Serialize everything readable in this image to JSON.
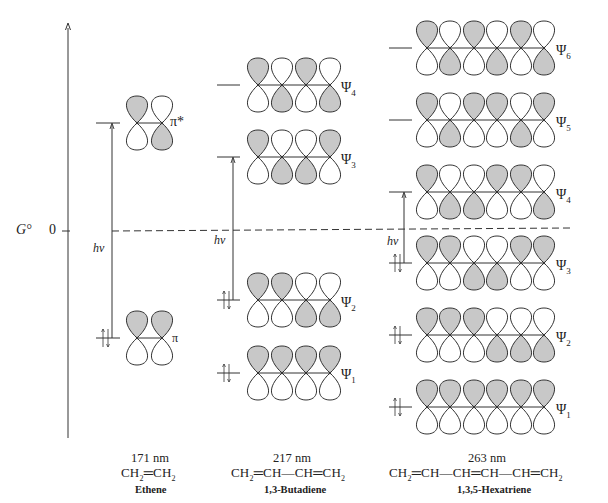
{
  "axis": {
    "label": "G°",
    "zero_label": "0",
    "hv_label": "hν"
  },
  "colors": {
    "shaded_lobe": "#c8c8c8",
    "line": "#333333",
    "background": "#ffffff"
  },
  "molecules": [
    {
      "name": "Ethene",
      "wavelength": "171 nm",
      "formula": "CH₂═CH₂",
      "orbitals": [
        {
          "label": "π*",
          "sub": "",
          "occupied": false,
          "top_shaded": [
            true,
            false
          ]
        },
        {
          "label": "π",
          "sub": "",
          "occupied": true,
          "top_shaded": [
            true,
            true
          ]
        }
      ]
    },
    {
      "name": "1,3-Butadiene",
      "wavelength": "217 nm",
      "formula": "CH₂═CH—CH═CH₂",
      "orbitals": [
        {
          "label": "Ψ",
          "sub": "4",
          "occupied": false,
          "top_shaded": [
            true,
            false,
            true,
            false
          ]
        },
        {
          "label": "Ψ",
          "sub": "3",
          "occupied": false,
          "top_shaded": [
            true,
            false,
            false,
            true
          ]
        },
        {
          "label": "Ψ",
          "sub": "2",
          "occupied": true,
          "top_shaded": [
            true,
            true,
            false,
            false
          ]
        },
        {
          "label": "Ψ",
          "sub": "1",
          "occupied": true,
          "top_shaded": [
            true,
            true,
            true,
            true
          ]
        }
      ]
    },
    {
      "name": "1,3,5-Hexatriene",
      "wavelength": "263 nm",
      "formula": "CH₂═CH—CH═CH—CH═CH₂",
      "orbitals": [
        {
          "label": "Ψ",
          "sub": "6",
          "occupied": false,
          "top_shaded": [
            true,
            false,
            true,
            false,
            true,
            false
          ]
        },
        {
          "label": "Ψ",
          "sub": "5",
          "occupied": false,
          "top_shaded": [
            true,
            false,
            true,
            true,
            false,
            true
          ]
        },
        {
          "label": "Ψ",
          "sub": "4",
          "occupied": false,
          "top_shaded": [
            true,
            false,
            false,
            true,
            true,
            false
          ]
        },
        {
          "label": "Ψ",
          "sub": "3",
          "occupied": true,
          "top_shaded": [
            true,
            true,
            false,
            false,
            true,
            true
          ]
        },
        {
          "label": "Ψ",
          "sub": "2",
          "occupied": true,
          "top_shaded": [
            true,
            true,
            true,
            false,
            false,
            false
          ]
        },
        {
          "label": "Ψ",
          "sub": "1",
          "occupied": true,
          "top_shaded": [
            true,
            true,
            true,
            true,
            true,
            true
          ]
        }
      ]
    }
  ],
  "chart_data": {
    "type": "diagram",
    "ylabel": "G°",
    "series": [
      {
        "name": "Ethene",
        "lambda_max_nm": 171,
        "transition": "π → π*"
      },
      {
        "name": "1,3-Butadiene",
        "lambda_max_nm": 217,
        "transition": "Ψ2 → Ψ3"
      },
      {
        "name": "1,3,5-Hexatriene",
        "lambda_max_nm": 263,
        "transition": "Ψ3 → Ψ4"
      }
    ]
  }
}
